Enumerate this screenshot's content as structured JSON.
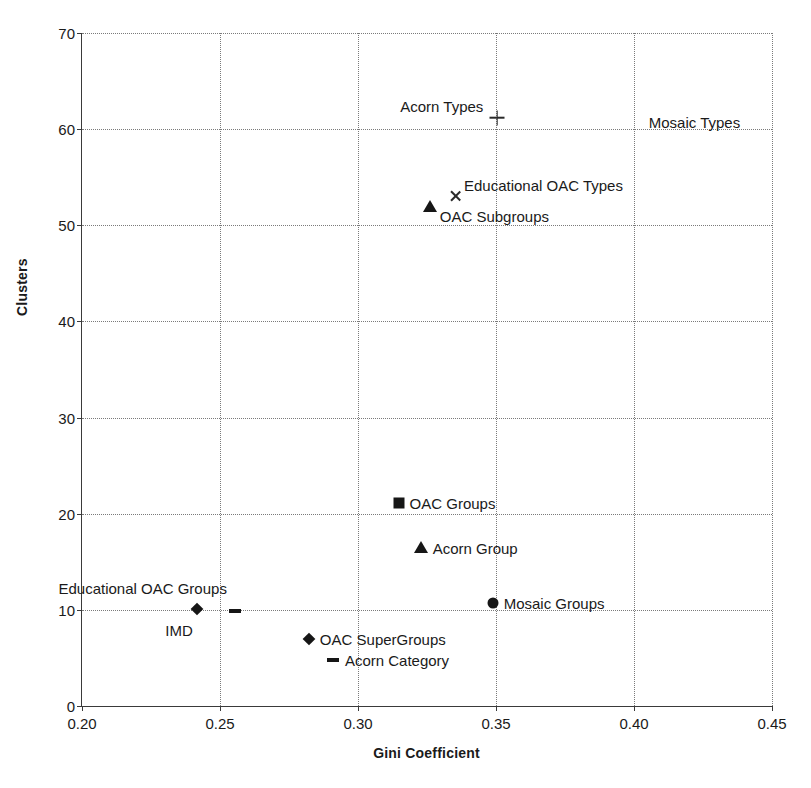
{
  "chart_data": {
    "type": "scatter",
    "title": "",
    "xlabel": "Gini Coefficient",
    "ylabel": "Clusters",
    "xlim": [
      0.2,
      0.45
    ],
    "ylim": [
      0,
      70
    ],
    "xticks": [
      "0.20",
      "0.25",
      "0.30",
      "0.35",
      "0.40",
      "0.45"
    ],
    "xtick_values": [
      0.2,
      0.25,
      0.3,
      0.35,
      0.4,
      0.45
    ],
    "yticks": [
      "0",
      "10",
      "20",
      "30",
      "40",
      "50",
      "60",
      "70"
    ],
    "ytick_values": [
      0,
      10,
      20,
      30,
      40,
      50,
      60,
      70
    ],
    "grid": true,
    "legend": "none, points labelled in place",
    "points": [
      {
        "label": "Acorn Types",
        "x": 0.3505,
        "y": 61.2,
        "marker": "plus",
        "label_side": "left",
        "label_dx": -14,
        "label_dy": -12
      },
      {
        "label": "Mosaic Types",
        "x": 0.401,
        "y": 60.7,
        "marker": "cross-bold",
        "label_side": "right",
        "label_dx": 12,
        "label_dy": 0
      },
      {
        "label": "Educational OAC Types",
        "x": 0.3355,
        "y": 53.0,
        "marker": "cross",
        "label_side": "right",
        "label_dx": 8,
        "label_dy": -11
      },
      {
        "label": "OAC Subgroups",
        "x": 0.326,
        "y": 52.0,
        "marker": "triangle",
        "label_side": "right",
        "label_dx": 10,
        "label_dy": 10
      },
      {
        "label": "OAC Groups",
        "x": 0.3147,
        "y": 21.1,
        "marker": "square",
        "label_side": "right",
        "label_dx": 11,
        "label_dy": 0
      },
      {
        "label": "Acorn Group",
        "x": 0.3227,
        "y": 16.5,
        "marker": "triangle",
        "label_side": "right",
        "label_dx": 12,
        "label_dy": 1
      },
      {
        "label": "Mosaic Groups",
        "x": 0.3488,
        "y": 10.7,
        "marker": "circle",
        "label_side": "right",
        "label_dx": 11,
        "label_dy": 0
      },
      {
        "label": "IMD",
        "x": 0.2416,
        "y": 10.1,
        "marker": "diamond",
        "label_side": "left",
        "label_dx": -4,
        "label_dy": 21
      },
      {
        "label": "Educational OAC Groups",
        "x": 0.2554,
        "y": 9.9,
        "marker": "dash",
        "label_side": "left",
        "label_dx": -8,
        "label_dy": -23
      },
      {
        "label": "OAC SuperGroups",
        "x": 0.2822,
        "y": 7.0,
        "marker": "diamond",
        "label_side": "right",
        "label_dx": 11,
        "label_dy": 0
      },
      {
        "label": "Acorn Category",
        "x": 0.2909,
        "y": 4.8,
        "marker": "dash",
        "label_side": "right",
        "label_dx": 12,
        "label_dy": 0
      }
    ]
  }
}
